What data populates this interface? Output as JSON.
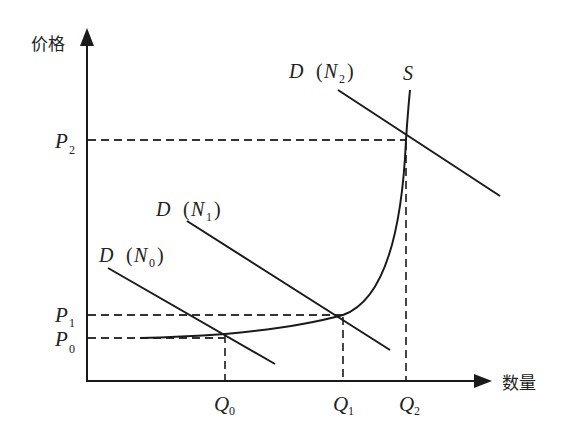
{
  "diagram": {
    "type": "supply-demand",
    "axes": {
      "y_label": "价格",
      "x_label": "数量"
    },
    "price_levels": [
      {
        "main": "P",
        "sub": "2"
      },
      {
        "main": "P",
        "sub": "1"
      },
      {
        "main": "P",
        "sub": "0"
      }
    ],
    "quantity_levels": [
      {
        "main": "Q",
        "sub": "0"
      },
      {
        "main": "Q",
        "sub": "1"
      },
      {
        "main": "Q",
        "sub": "2"
      }
    ],
    "curves": {
      "supply": {
        "label": "S"
      },
      "demand": [
        {
          "prefix": "D",
          "open": "(",
          "main": "N",
          "sub": "0",
          "close": ")"
        },
        {
          "prefix": "D",
          "open": "(",
          "main": "N",
          "sub": "1",
          "close": ")"
        },
        {
          "prefix": "D",
          "open": "(",
          "main": "N",
          "sub": "2",
          "close": ")"
        }
      ]
    },
    "equilibria": [
      {
        "demand": "D(N0)",
        "price": "P0",
        "quantity": "Q0"
      },
      {
        "demand": "D(N1)",
        "price": "P1",
        "quantity": "Q1"
      },
      {
        "demand": "D(N2)",
        "price": "P2",
        "quantity": "Q2"
      }
    ],
    "colors": {
      "line": "#1a1a1a",
      "dash": "#333333",
      "background": "#ffffff"
    }
  }
}
